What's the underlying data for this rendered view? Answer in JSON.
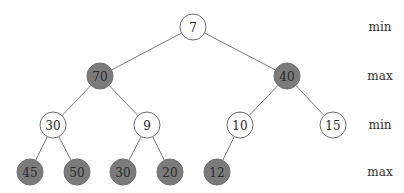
{
  "diagram": {
    "type": "min-max-heap",
    "nodes": [
      {
        "id": "n0",
        "value": "7",
        "level": 0,
        "kind": "min"
      },
      {
        "id": "n1",
        "value": "70",
        "level": 1,
        "kind": "max"
      },
      {
        "id": "n2",
        "value": "40",
        "level": 1,
        "kind": "max"
      },
      {
        "id": "n3",
        "value": "30",
        "level": 2,
        "kind": "min"
      },
      {
        "id": "n4",
        "value": "9",
        "level": 2,
        "kind": "min"
      },
      {
        "id": "n5",
        "value": "10",
        "level": 2,
        "kind": "min"
      },
      {
        "id": "n6",
        "value": "15",
        "level": 2,
        "kind": "min"
      },
      {
        "id": "n7",
        "value": "45",
        "level": 3,
        "kind": "max"
      },
      {
        "id": "n8",
        "value": "50",
        "level": 3,
        "kind": "max"
      },
      {
        "id": "n9",
        "value": "30",
        "level": 3,
        "kind": "max"
      },
      {
        "id": "n10",
        "value": "20",
        "level": 3,
        "kind": "max"
      },
      {
        "id": "n11",
        "value": "12",
        "level": 3,
        "kind": "max"
      }
    ],
    "edges": [
      [
        "n0",
        "n1"
      ],
      [
        "n0",
        "n2"
      ],
      [
        "n1",
        "n3"
      ],
      [
        "n1",
        "n4"
      ],
      [
        "n2",
        "n5"
      ],
      [
        "n2",
        "n6"
      ],
      [
        "n3",
        "n7"
      ],
      [
        "n3",
        "n8"
      ],
      [
        "n4",
        "n9"
      ],
      [
        "n4",
        "n10"
      ],
      [
        "n5",
        "n11"
      ]
    ],
    "level_labels": [
      "min",
      "max",
      "min",
      "max"
    ],
    "colors": {
      "min_fill": "#ffffff",
      "max_fill": "#7b7b7b"
    }
  }
}
